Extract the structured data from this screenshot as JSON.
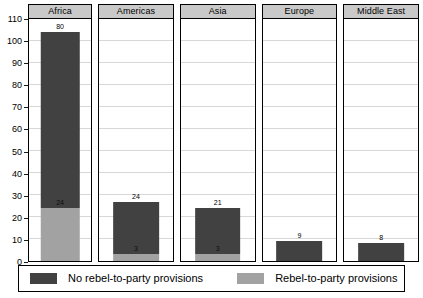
{
  "chart_data": {
    "type": "bar",
    "subtype": "stacked-bar-faceted",
    "title": "",
    "xlabel": "",
    "ylabel": "",
    "ylim": [
      0,
      110
    ],
    "ytick_step": 10,
    "yticks": [
      110,
      100,
      90,
      80,
      70,
      60,
      50,
      40,
      30,
      20,
      10,
      0
    ],
    "grid": true,
    "grid_axis": "y",
    "legend_position": "bottom",
    "categories": [
      "Africa",
      "Americas",
      "Asia",
      "Europe",
      "Middle East"
    ],
    "series": [
      {
        "name": "No rebel-to-party provisions",
        "color": "#414141",
        "values": [
          80,
          24,
          21,
          9,
          8
        ]
      },
      {
        "name": "Rebel-to-party provisions",
        "color": "#a2a2a2",
        "values": [
          24,
          3,
          3,
          0,
          0
        ]
      }
    ],
    "totals": [
      104,
      27,
      24,
      9,
      8
    ],
    "panels": [
      {
        "name": "Africa",
        "dark_value": 80,
        "light_value": 24,
        "total": 104,
        "dark_label": "80",
        "light_label": "24",
        "show_light_label": true
      },
      {
        "name": "Americas",
        "dark_value": 24,
        "light_value": 3,
        "total": 27,
        "dark_label": "24",
        "light_label": "3",
        "show_light_label": true
      },
      {
        "name": "Asia",
        "dark_value": 21,
        "light_value": 3,
        "total": 24,
        "dark_label": "21",
        "light_label": "3",
        "show_light_label": true
      },
      {
        "name": "Europe",
        "dark_value": 9,
        "light_value": 0,
        "total": 9,
        "dark_label": "9",
        "light_label": "",
        "show_light_label": false
      },
      {
        "name": "Middle East",
        "dark_value": 8,
        "light_value": 0,
        "total": 8,
        "dark_label": "8",
        "light_label": "",
        "show_light_label": false
      }
    ]
  },
  "legend": {
    "entries": [
      {
        "label": "No rebel-to-party provisions",
        "color": "#414141"
      },
      {
        "label": "Rebel-to-party provisions",
        "color": "#a2a2a2"
      }
    ]
  },
  "colors": {
    "dark_series": "#414141",
    "light_series": "#a2a2a2",
    "panel_header_bg": "#c9c9c9",
    "gridline": "#d8d8d8",
    "border": "#000000",
    "plot_bg": "#ffffff"
  }
}
